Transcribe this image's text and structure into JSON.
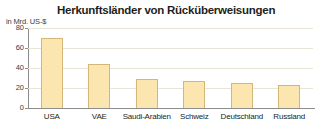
{
  "chart_data": {
    "type": "bar",
    "title": "Herkunftsländer von Rücküberweisungen",
    "ylabel": "in Mrd. US-$",
    "xlabel": "",
    "categories": [
      "USA",
      "VAE",
      "Saudi-Arabien",
      "Schweiz",
      "Deutschland",
      "Russland"
    ],
    "values": [
      70,
      44,
      29,
      27,
      25,
      23
    ],
    "ylim": [
      0,
      80
    ],
    "yticks": [
      0,
      20,
      40,
      60,
      80
    ],
    "ytick_labels": [
      "0",
      "20",
      "40",
      "60",
      "80"
    ],
    "grid": true,
    "legend": false,
    "bar_color": "#fae6ae",
    "bar_border_color": "#d4b778",
    "axis_color": "#8c8c8c",
    "grid_color": "#e9e4d8",
    "text_color": "#231f20",
    "background": "#ffffff"
  }
}
